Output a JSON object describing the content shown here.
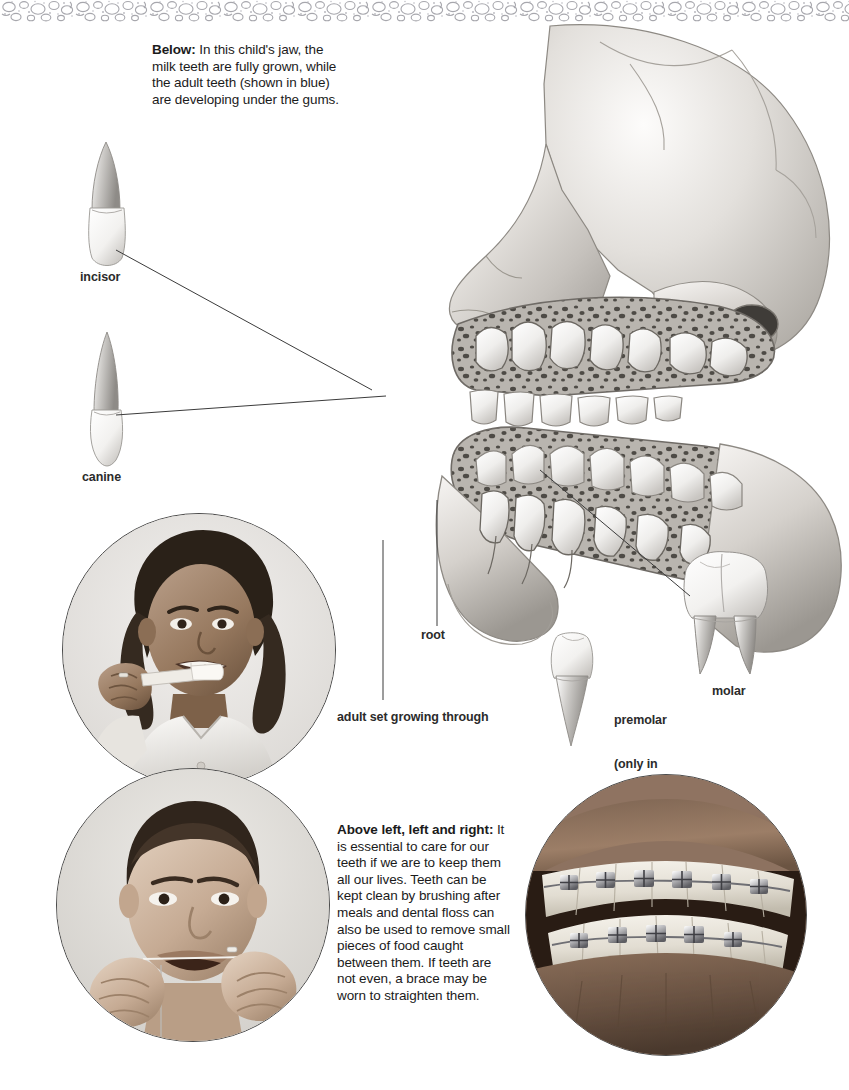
{
  "page": {
    "width": 849,
    "height": 1090,
    "background": "#ffffff",
    "ink": "#231f20",
    "decor_band": "bone-texture-pattern"
  },
  "captions": {
    "top": {
      "lead": "Below:",
      "body": " In this child's jaw, the milk teeth are fully grown, while the adult teeth (shown in blue) are developing under the gums."
    },
    "bottom": {
      "lead": "Above left, left and right:",
      "body": " It is essential to care for our teeth if we are to keep them all our lives. Teeth can be kept clean by brushing after meals and dental floss can also be used to remove small pieces of food caught between them. If teeth are not even, a brace may be worn to straighten them."
    }
  },
  "labels": {
    "incisor": "incisor",
    "canine": "canine",
    "root": "root",
    "adult_set": "adult set growing through",
    "premolar_line1": "premolar",
    "premolar_line2": "(only in",
    "premolar_line3": "adult set)",
    "molar": "molar"
  },
  "figures": {
    "skull": {
      "name": "child-skull-jaw-cutaway",
      "description": "Lateral cutaway of a child's skull showing upper and lower jaw with milk teeth erupted and adult teeth developing inside the bone"
    },
    "incisor_tooth": {
      "name": "incisor-tooth-diagram"
    },
    "canine_tooth": {
      "name": "canine-tooth-diagram"
    },
    "premolar_tooth": {
      "name": "premolar-tooth-diagram"
    },
    "molar_tooth": {
      "name": "molar-tooth-diagram"
    }
  },
  "photos": [
    {
      "name": "photo-girl-brushing-teeth",
      "alt": "Girl brushing her teeth with a toothbrush"
    },
    {
      "name": "photo-boy-flossing-teeth",
      "alt": "Boy using dental floss between his teeth"
    },
    {
      "name": "photo-teeth-with-braces",
      "alt": "Close-up of teeth fitted with metal braces"
    }
  ]
}
